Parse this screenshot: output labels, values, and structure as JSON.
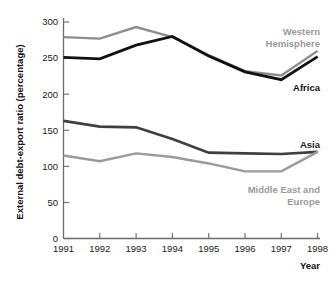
{
  "chart_data": {
    "type": "line",
    "title": "",
    "xlabel": "Year",
    "ylabel": "External debt-export ratio (percentage)",
    "x": [
      1991,
      1992,
      1993,
      1994,
      1995,
      1996,
      1997,
      1998
    ],
    "xticklabels": [
      "1991",
      "1992",
      "1993",
      "1994",
      "1995",
      "1996",
      "1997",
      "1998"
    ],
    "yticks": [
      0,
      50,
      100,
      150,
      200,
      250,
      300
    ],
    "yticklabels": [
      "0",
      "50",
      "100",
      "150",
      "200",
      "250",
      "300"
    ],
    "ylim": [
      0,
      315
    ],
    "xlim": [
      1991,
      1998
    ],
    "grid": false,
    "legend_position": "inline-right",
    "series": [
      {
        "name": "Western Hemisphere",
        "color": "#8c8c8c",
        "values": [
          279,
          277,
          293,
          279,
          254,
          232,
          226,
          260
        ],
        "label_lines": [
          "Western",
          "Hemisphere"
        ],
        "label_color": "#9a9a9a"
      },
      {
        "name": "Africa",
        "color": "#111111",
        "values": [
          251,
          249,
          268,
          280,
          253,
          231,
          220,
          252
        ],
        "label_lines": [
          "Africa"
        ],
        "label_color": "#111111"
      },
      {
        "name": "Asia",
        "color": "#3f3f3f",
        "values": [
          163,
          155,
          154,
          138,
          119,
          118,
          117,
          120
        ],
        "label_lines": [
          "Asia"
        ],
        "label_color": "#1a1a1a"
      },
      {
        "name": "Middle East and Europe",
        "color": "#9a9a9a",
        "values": [
          115,
          107,
          118,
          113,
          104,
          93,
          93,
          120
        ],
        "label_lines": [
          "Middle East and",
          "Europe"
        ],
        "label_color": "#9a9a9a"
      }
    ]
  },
  "axes": {
    "y_title": "External debt-export ratio (percentage)",
    "x_title": "Year"
  },
  "labels": {
    "western_hemisphere_line1": "Western",
    "western_hemisphere_line2": "Hemisphere",
    "africa": "Africa",
    "asia": "Asia",
    "middle_east_line1": "Middle East and",
    "middle_east_line2": "Europe"
  },
  "yticklabels": {
    "t0": "0",
    "t50": "50",
    "t100": "100",
    "t150": "150",
    "t200": "200",
    "t250": "250",
    "t300": "300"
  },
  "xticklabels": {
    "t1991": "1991",
    "t1992": "1992",
    "t1993": "1993",
    "t1994": "1994",
    "t1995": "1995",
    "t1996": "1996",
    "t1997": "1997",
    "t1998": "1998"
  }
}
